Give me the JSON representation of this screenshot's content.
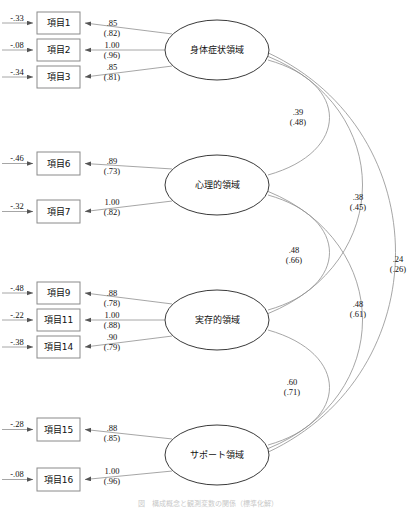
{
  "diagram": {
    "type": "structural-equation-model-path-diagram",
    "arrowhead_color": "#555555",
    "line_color": "#8f8f8f",
    "box_stroke": "#8a8a8a",
    "ellipse_stroke": "#3a3a3a",
    "caption": "図　構成概念と観測変数の関係（標準化解）"
  },
  "factors": [
    {
      "id": "f1",
      "label": "身体症状領域",
      "cx": 217,
      "cy": 50,
      "rx": 52,
      "ry": 30,
      "indicators": [
        {
          "label": "項目1",
          "x": 37,
          "y": 12,
          "w": 43,
          "h": 22,
          "loading": ".85",
          "std": "(.82)",
          "error": "-.33"
        },
        {
          "label": "項目2",
          "x": 37,
          "y": 39,
          "w": 43,
          "h": 22,
          "loading": "1.00",
          "std": "(.96)",
          "error": "-.08"
        },
        {
          "label": "項目3",
          "x": 37,
          "y": 66,
          "w": 43,
          "h": 22,
          "loading": ".85",
          "std": "(.81)",
          "error": "-.34"
        }
      ]
    },
    {
      "id": "f2",
      "label": "心理的領域",
      "cx": 217,
      "cy": 185,
      "rx": 52,
      "ry": 30,
      "indicators": [
        {
          "label": "項目6",
          "x": 37,
          "y": 152,
          "w": 43,
          "h": 23,
          "loading": ".89",
          "std": "(.73)",
          "error": "-.46"
        },
        {
          "label": "項目7",
          "x": 37,
          "y": 200,
          "w": 43,
          "h": 23,
          "loading": "1.00",
          "std": "(.82)",
          "error": "-.32"
        }
      ]
    },
    {
      "id": "f3",
      "label": "実存的領域",
      "cx": 217,
      "cy": 320,
      "rx": 52,
      "ry": 30,
      "indicators": [
        {
          "label": "項目9",
          "x": 37,
          "y": 282,
          "w": 43,
          "h": 22,
          "loading": ".88",
          "std": "(.78)",
          "error": "-.48"
        },
        {
          "label": "項目11",
          "x": 37,
          "y": 309,
          "w": 43,
          "h": 22,
          "loading": "1.00",
          "std": "(.88)",
          "error": "-.22"
        },
        {
          "label": "項目14",
          "x": 37,
          "y": 336,
          "w": 43,
          "h": 22,
          "loading": ".90",
          "std": "(.79)",
          "error": "-.38"
        }
      ]
    },
    {
      "id": "f4",
      "label": "サポート領域",
      "cx": 217,
      "cy": 455,
      "rx": 52,
      "ry": 30,
      "indicators": [
        {
          "label": "項目15",
          "x": 37,
          "y": 418,
          "w": 43,
          "h": 23,
          "loading": ".88",
          "std": "(.85)",
          "error": "-.28"
        },
        {
          "label": "項目16",
          "x": 37,
          "y": 468,
          "w": 43,
          "h": 23,
          "loading": "1.00",
          "std": "(.96)",
          "error": "-.08"
        }
      ]
    }
  ],
  "correlations": [
    {
      "from": "f1",
      "to": "f2",
      "value": ".39",
      "std": "(.48)",
      "label_x": 298,
      "label_y": 115
    },
    {
      "from": "f2",
      "to": "f3",
      "value": ".48",
      "std": "(.66)",
      "label_x": 294,
      "label_y": 253
    },
    {
      "from": "f3",
      "to": "f4",
      "value": ".60",
      "std": "(.71)",
      "label_x": 292,
      "label_y": 385
    },
    {
      "from": "f1",
      "to": "f3",
      "value": ".38",
      "std": "(.45)",
      "label_x": 358,
      "label_y": 200
    },
    {
      "from": "f2",
      "to": "f4",
      "value": ".48",
      "std": "(.61)",
      "label_x": 358,
      "label_y": 307
    },
    {
      "from": "f1",
      "to": "f4",
      "value": ".24",
      "std": "(.26)",
      "label_x": 398,
      "label_y": 262
    }
  ]
}
